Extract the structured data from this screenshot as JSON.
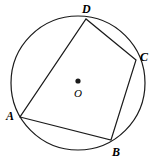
{
  "figure": {
    "background_color": "#ffffff",
    "stroke_color": "#1a1a1a",
    "stroke_width": 1.2,
    "canvas": {
      "width": 155,
      "height": 164
    }
  },
  "circle": {
    "name": "circumscribed-circle",
    "center_x": 78,
    "center_y": 83,
    "radius": 67,
    "center_dot_radius": 2.6,
    "center_label": "O",
    "center_label_x": 74,
    "center_label_y": 88
  },
  "vertices": [
    {
      "label": "A",
      "x": 20,
      "y": 117,
      "label_x": 6,
      "label_y": 110
    },
    {
      "label": "B",
      "x": 111,
      "y": 140,
      "label_x": 112,
      "label_y": 146
    },
    {
      "label": "C",
      "x": 136,
      "y": 60,
      "label_x": 140,
      "label_y": 51
    },
    {
      "label": "D",
      "x": 86,
      "y": 19,
      "label_x": 82,
      "label_y": 3
    }
  ],
  "edges": [
    {
      "name": "side-AB",
      "from": "A",
      "to": "B"
    },
    {
      "name": "side-BC",
      "from": "B",
      "to": "C"
    },
    {
      "name": "side-CD",
      "from": "C",
      "to": "D"
    },
    {
      "name": "side-DA",
      "from": "D",
      "to": "A"
    }
  ]
}
